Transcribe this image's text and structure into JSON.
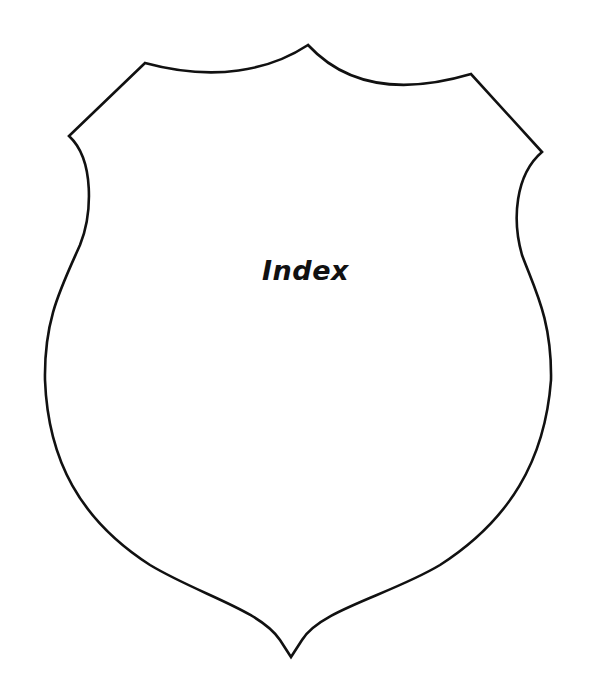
{
  "page": {
    "title": "Index",
    "background_color": "#ffffff",
    "outline_color": "#111111"
  },
  "shield": {
    "icon": "shield-outline",
    "stroke_width": 2.6
  }
}
